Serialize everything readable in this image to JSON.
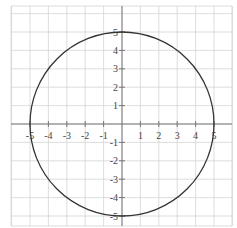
{
  "chart_data": {
    "type": "line",
    "title": "",
    "xlabel": "",
    "ylabel": "",
    "xlim": [
      -5.5,
      5.5
    ],
    "ylim": [
      -5.5,
      5.5
    ],
    "grid": true,
    "x_ticks": [
      -5,
      -4,
      -3,
      -2,
      -1,
      1,
      2,
      3,
      4,
      5
    ],
    "y_ticks": [
      5,
      4,
      3,
      2,
      1,
      -1,
      -2,
      -3,
      -4,
      -5
    ],
    "x_tick_labels": [
      "-5",
      "-4",
      "-3",
      "-2",
      "-1",
      "1",
      "2",
      "3",
      "4",
      "5"
    ],
    "y_tick_labels": [
      "5",
      "4",
      "3",
      "2",
      "1",
      "-1",
      "-2",
      "-3",
      "-4",
      "-5"
    ],
    "series": [
      {
        "name": "circle",
        "shape": "circle",
        "center": [
          0,
          0
        ],
        "radius": 5,
        "equation": "x^2 + y^2 = 25",
        "color": "#333333"
      }
    ]
  },
  "colors": {
    "grid": "#d4d4d4",
    "axis": "#777777",
    "curve": "#333333",
    "label": "#444444"
  }
}
